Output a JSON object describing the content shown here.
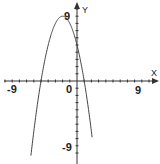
{
  "chart_data": {
    "type": "line",
    "title": "",
    "xlabel": "X",
    "ylabel": "Y",
    "xlim": [
      -10,
      10
    ],
    "ylim": [
      -10,
      10
    ],
    "grid": false,
    "tick_labels": {
      "x": [
        "-9",
        "0",
        "9"
      ],
      "y": [
        "9",
        "-9"
      ]
    },
    "series": [
      {
        "name": "y = -(x+2)^2 + 9",
        "function": "-x^2 - 4x + 5",
        "x": [
          -6.2,
          -5,
          -4,
          -3,
          -2,
          -1,
          0,
          1,
          2
        ],
        "y": [
          -5.44,
          0,
          5,
          8,
          9,
          8,
          5,
          0,
          -7
        ]
      }
    ],
    "annotations": []
  },
  "labels": {
    "x_axis": "X",
    "y_axis": "Y",
    "x_neg": "-9",
    "x_pos": "9",
    "origin": "0",
    "y_pos": "9",
    "y_neg": "-9"
  }
}
